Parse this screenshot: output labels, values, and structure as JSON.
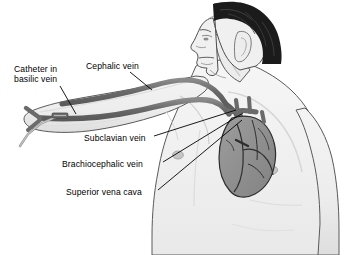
{
  "figure": {
    "background_color": "#ffffff"
  },
  "palette": {
    "skin_fill": "#f2f2f2",
    "skin_shade": "#e3e3e3",
    "skin_shade_dark": "#d2d2d2",
    "outline": "#5a5a5a",
    "vein_gray": "#6b6b6b",
    "vein_gray_dark": "#5e5e5e",
    "heart_gray": "#8f8f8f",
    "heart_outline": "#2e2e2e",
    "hair_black": "#1b1b1b",
    "catheter_gray": "#9a9a9a",
    "label_text": "#000000",
    "leader_line": "#000000"
  },
  "labels": [
    {
      "id": "catheter-in-basilic-vein",
      "line1": "Catheter in",
      "line2": "basilic vein",
      "x": 14,
      "y": 64
    },
    {
      "id": "cephalic-vein",
      "line1": "Cephalic vein",
      "line2": "",
      "x": 86,
      "y": 61
    },
    {
      "id": "subclavian-vein",
      "line1": "Subclavian vein",
      "line2": "",
      "x": 84,
      "y": 138
    },
    {
      "id": "brachiocephalic-vein",
      "line1": "Brachiocephalic vein",
      "line2": "",
      "x": 62,
      "y": 164
    },
    {
      "id": "superior-vena-cava",
      "line1": "Superior vena cava",
      "line2": "",
      "x": 66,
      "y": 192
    }
  ],
  "anatomy": {
    "parts": [
      {
        "id": "head-profile",
        "name": "head-profile"
      },
      {
        "id": "hair",
        "name": "hair"
      },
      {
        "id": "ear",
        "name": "ear"
      },
      {
        "id": "neck",
        "name": "neck"
      },
      {
        "id": "torso",
        "name": "torso"
      },
      {
        "id": "left-arm",
        "name": "outstretched-arm"
      },
      {
        "id": "right-arm",
        "name": "right-arm"
      },
      {
        "id": "nipple-left",
        "name": "nipple"
      },
      {
        "id": "nipple-right",
        "name": "nipple"
      },
      {
        "id": "heart",
        "name": "heart"
      },
      {
        "id": "cephalic-vein-vessel",
        "name": "cephalic-vein-vessel"
      },
      {
        "id": "basilic-vein-vessel",
        "name": "basilic-vein-vessel"
      },
      {
        "id": "subclavian-vein-vessel",
        "name": "subclavian-vein-vessel"
      },
      {
        "id": "brachiocephalic-vein-vessel",
        "name": "brachiocephalic-vein-vessel"
      },
      {
        "id": "superior-vena-cava-vessel",
        "name": "superior-vena-cava-vessel"
      },
      {
        "id": "catheter-tube",
        "name": "catheter-tube"
      },
      {
        "id": "catheter-hub",
        "name": "catheter-hub"
      }
    ]
  }
}
